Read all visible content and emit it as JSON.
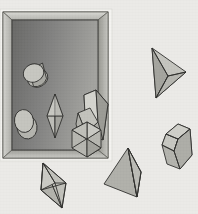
{
  "scene": {
    "title": "Geometric solids with picture frame",
    "background_color": "#ebeae7",
    "canvas": {
      "width": 198,
      "height": 214
    }
  },
  "frame": {
    "name": "picture-frame",
    "outer": {
      "x": 2,
      "y": 11,
      "width": 106,
      "height": 148
    },
    "outer_highlight_color": "#f2f1ee",
    "border_light_color": "#cfcfca",
    "border_mid_color": "#a8a8a3",
    "border_dark_color": "#8e8e89",
    "outline_color": "#4a4a48",
    "inner": {
      "x": 10,
      "y": 19,
      "width": 88,
      "height": 130
    },
    "inner_gradient_from": "#6e6e6c",
    "inner_gradient_to": "#9d9d99"
  },
  "solids": {
    "stroke_color": "#3a3a38",
    "fill_light": "#c8c8c4",
    "fill_mid": "#b0b0ab",
    "fill_dark": "#9a9a95",
    "fill_darker": "#86868151",
    "items": [
      {
        "name": "cylinder-upper-inside-frame",
        "type": "cylinder",
        "location": "inside-frame"
      },
      {
        "name": "cylinder-lower-inside-frame",
        "type": "cylinder",
        "location": "inside-frame"
      },
      {
        "name": "bipyramid-inside-frame",
        "type": "bipyramid",
        "location": "inside-frame"
      },
      {
        "name": "parallelepiped-box",
        "type": "parallelepiped",
        "location": "overlapping-frame-edge"
      },
      {
        "name": "hexagonal-octahedron",
        "type": "octahedron",
        "location": "overlapping-frame-edge"
      },
      {
        "name": "tetrahedron-upper-right",
        "type": "tetrahedron",
        "location": "outside-frame"
      },
      {
        "name": "hexagonal-prism-right",
        "type": "hexagonal-prism",
        "location": "outside-frame"
      },
      {
        "name": "tetrahedron-bottom-center",
        "type": "tetrahedron",
        "location": "outside-frame"
      },
      {
        "name": "bipyramid-bottom-left",
        "type": "bipyramid",
        "location": "outside-frame"
      }
    ]
  }
}
